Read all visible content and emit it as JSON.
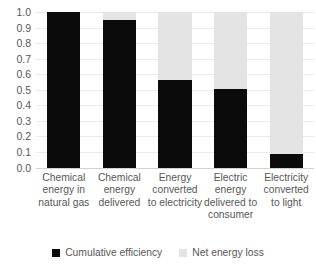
{
  "chart_data": {
    "type": "bar",
    "title": "",
    "xlabel": "",
    "ylabel": "",
    "stacked": true,
    "grid": true,
    "legend_position": "bottom",
    "ylim": [
      0.0,
      1.0
    ],
    "ytick_labels": [
      "1.0",
      "0.9",
      "0.8",
      "0.7",
      "0.6",
      "0.5",
      "0.4",
      "0.3",
      "0.2",
      "0.1",
      "0.0"
    ],
    "ytick_values": [
      1.0,
      0.9,
      0.8,
      0.7,
      0.6,
      0.5,
      0.4,
      0.3,
      0.2,
      0.1,
      0.0
    ],
    "categories": [
      "Chemical energy in natural gas",
      "Chemical energy delivered",
      "Energy converted to electricity",
      "Electric energy delivered to consumer",
      "Electricity converted to light"
    ],
    "series": [
      {
        "name": "Cumulative efficiency",
        "color": "#0b0b0b",
        "values": [
          1.0,
          0.95,
          0.565,
          0.505,
          0.085
        ]
      },
      {
        "name": "Net energy loss",
        "color": "#e4e4e4",
        "values": [
          0.0,
          0.05,
          0.435,
          0.495,
          0.915
        ]
      }
    ]
  }
}
